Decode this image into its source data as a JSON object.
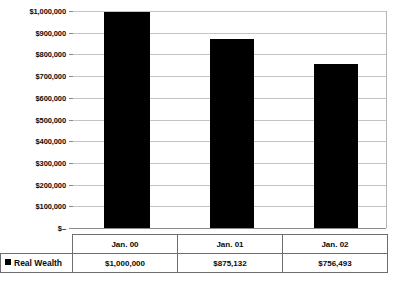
{
  "chart_data": {
    "type": "bar",
    "title": "",
    "xlabel": "",
    "ylabel": "",
    "categories": [
      "Jan. 00",
      "Jan. 01",
      "Jan. 02"
    ],
    "series": [
      {
        "name": "Real Wealth",
        "values": [
          1000000,
          875132,
          756493
        ],
        "value_labels": [
          "$1,000,000",
          "$875,132",
          "$756,493"
        ],
        "color": "#000000"
      }
    ],
    "ylim": [
      0,
      1000000
    ],
    "ytick_values": [
      1000000,
      900000,
      800000,
      700000,
      600000,
      500000,
      400000,
      300000,
      200000,
      100000,
      0
    ],
    "ytick_labels": [
      "$1,000,000",
      "$900,000",
      "$800,000",
      "$700,000",
      "$600,000",
      "$500,000",
      "$400,000",
      "$300,000",
      "$200,000",
      "$100,000",
      "$–"
    ],
    "grid": true,
    "grid_color": "#c4c4c4",
    "axis_color": "#8a8a8a",
    "legend_position": "data-table-row-header",
    "legend_entries": [
      {
        "label": "Real Wealth",
        "color": "#000000",
        "marker": "square"
      }
    ]
  },
  "data_table": {
    "row_header_label": "Real Wealth",
    "column_headers": [
      "Jan. 00",
      "Jan. 01",
      "Jan. 02"
    ],
    "rows": [
      {
        "label": "Real Wealth",
        "cells": [
          "$1,000,000",
          "$875,132",
          "$756,493"
        ]
      }
    ]
  }
}
